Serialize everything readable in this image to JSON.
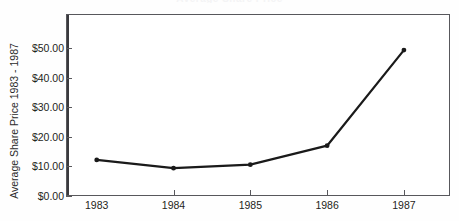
{
  "chart_data": {
    "type": "line",
    "title": "Average Share Price",
    "xlabel": "",
    "ylabel": "Average Share Price 1983 - 1987",
    "categories": [
      "1983",
      "1984",
      "1985",
      "1986",
      "1987"
    ],
    "x": [
      1983,
      1984,
      1985,
      1986,
      1987
    ],
    "values": [
      12.2,
      9.4,
      10.6,
      17.0,
      49.3
    ],
    "series": [
      {
        "name": "Average Share Price",
        "values": [
          12.2,
          9.4,
          10.6,
          17.0,
          49.3
        ]
      }
    ],
    "ylim": [
      0,
      61.5
    ],
    "xlim": [
      1982.6,
      1987.6
    ],
    "ytick_labels": [
      "$0.00",
      "$10.00",
      "$20.00",
      "$30.00",
      "$40.00",
      "$50.00"
    ],
    "ytick_values": [
      0,
      10,
      20,
      30,
      40,
      50
    ],
    "xtick_labels": [
      "1983",
      "1984",
      "1985",
      "1986",
      "1987"
    ],
    "grid": false,
    "legend": "none",
    "line_color": "#1a1a1a",
    "marker": "circle",
    "marker_color": "#1a1a1a",
    "background_color": "#ffffff",
    "axis_color": "#58585c"
  }
}
